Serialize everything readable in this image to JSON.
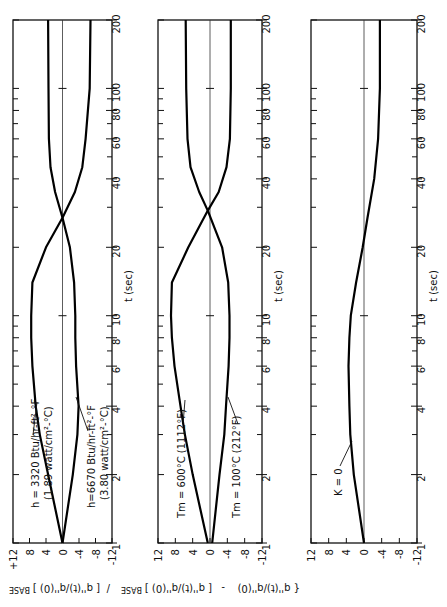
{
  "chart_data": [
    {
      "type": "line",
      "panel": 1,
      "title": "",
      "xlabel": "t (sec)",
      "xscale": "log",
      "xlim": [
        1,
        200
      ],
      "x_ticks": [
        1,
        2,
        4,
        6,
        8,
        10,
        20,
        40,
        60,
        80,
        100,
        200
      ],
      "ylabel": "{ q''(t)/q''(0) - [q''(t)/q''(0)]_BASE } / [q''(t)/q''(0)]_BASE",
      "ylim": [
        -12,
        12
      ],
      "y_ticks": [
        "+12",
        "8",
        "4",
        "0",
        "-4",
        "-8",
        "-12"
      ],
      "grid": false,
      "series": [
        {
          "name": "h = 3320 Btu/hr-ft2-°F (1.89 watt/cm2-°C)",
          "x": [
            1,
            2,
            3,
            4,
            6,
            8,
            10,
            14,
            20,
            27,
            35,
            45,
            60,
            100,
            200
          ],
          "y": [
            0,
            3.5,
            5.5,
            6.5,
            7.3,
            7.6,
            7.6,
            7.3,
            4.0,
            0,
            -3.0,
            -4.8,
            -5.6,
            -6.6,
            -6.8
          ]
        },
        {
          "name": "h = 6670 Btu/hr-ft2-°F (3.80 watt/cm2-°C)",
          "x": [
            1,
            2,
            3,
            4,
            6,
            8,
            10,
            14,
            20,
            27,
            35,
            45,
            60,
            100,
            200
          ],
          "y": [
            0,
            -2.5,
            -3.6,
            -3.9,
            -3.3,
            -3.1,
            -3.1,
            -2.8,
            -1.8,
            0,
            1.8,
            2.9,
            3.3,
            3.4,
            3.5
          ]
        }
      ]
    },
    {
      "type": "line",
      "panel": 2,
      "xlabel": "t (sec)",
      "xscale": "log",
      "xlim": [
        1,
        200
      ],
      "x_ticks": [
        1,
        2,
        4,
        6,
        8,
        10,
        20,
        40,
        60,
        80,
        100,
        200
      ],
      "ylim": [
        -12,
        12
      ],
      "y_ticks": [
        "12",
        "8",
        "4",
        "0",
        "-4",
        "-8",
        "-12"
      ],
      "series": [
        {
          "name": "Tm = 600°C (1112°F)",
          "x": [
            1,
            2,
            3,
            4,
            6,
            8,
            10,
            14,
            20,
            29,
            35,
            45,
            60,
            100,
            200
          ],
          "y": [
            0.5,
            4.0,
            5.8,
            6.8,
            8.2,
            8.8,
            9.0,
            8.8,
            5.0,
            0.5,
            -2.0,
            -3.8,
            -4.6,
            -4.8,
            -4.8
          ]
        },
        {
          "name": "Tm = 100°C (212°F)",
          "x": [
            1,
            2,
            3,
            4,
            6,
            8,
            10,
            14,
            20,
            29,
            35,
            45,
            60,
            100,
            200
          ],
          "y": [
            -0.5,
            -2.2,
            -3.3,
            -3.7,
            -4.3,
            -4.5,
            -4.5,
            -4.2,
            -2.8,
            0.5,
            2.5,
            4.5,
            5.2,
            5.5,
            5.6
          ]
        }
      ]
    },
    {
      "type": "line",
      "panel": 3,
      "xlabel": "t (sec)",
      "xscale": "log",
      "xlim": [
        1,
        200
      ],
      "x_ticks": [
        1,
        2,
        4,
        6,
        8,
        10,
        20,
        40,
        60,
        80,
        100,
        200
      ],
      "ylim": [
        -12,
        12
      ],
      "y_ticks": [
        "12",
        "8",
        "4",
        "0",
        "-4",
        "-8",
        "-12"
      ],
      "series": [
        {
          "name": "K = 0",
          "x": [
            1,
            2,
            3,
            4,
            6,
            8,
            10,
            14,
            20,
            27,
            40,
            60,
            100,
            200
          ],
          "y": [
            0,
            2.3,
            3.1,
            3.3,
            3.5,
            3.3,
            3.0,
            1.8,
            0.3,
            -0.8,
            -2.3,
            -3.2,
            -3.6,
            -3.6
          ]
        }
      ]
    }
  ],
  "labels": {
    "x_axis": "t (sec)",
    "y_axis_left": "{ q''(t)/q''(0)",
    "y_axis_minus": "-",
    "y_axis_base": "[ q''(t)/q''(0) ]",
    "base_sub": "BASE",
    "y_axis_over": "/",
    "x_tick_labels": [
      "1",
      "2",
      "4",
      "6",
      "8",
      "10",
      "20",
      "40",
      "60",
      "80",
      "100",
      "200"
    ],
    "panel1_y_ticks": [
      "+12",
      "8",
      "4",
      "0",
      "-4",
      "-8",
      "-12"
    ],
    "panel23_y_ticks": [
      "12",
      "8",
      "4",
      "0",
      "-4",
      "-8",
      "-12"
    ],
    "ann_h1_line1": "h = 3320 Btu/hr-ft²-°F",
    "ann_h1_line2": "(1.89 watt/cm²-°C)",
    "ann_h2_line1": "h=6670 Btu/hr-ft²-°F",
    "ann_h2_line2": "(3.80 watt/cm²-°C)",
    "ann_tm600": "Tm = 600°C (1112°F)",
    "ann_tm100": "Tm = 100°C (212°F)",
    "ann_k0": "K = 0"
  }
}
